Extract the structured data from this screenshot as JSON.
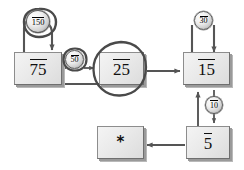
{
  "diagram": {
    "type": "state-transition-diagram",
    "background_color": "#ffffff",
    "edge_color": "#555555",
    "node_fill": "#eaeaea",
    "node_border": "#8d8d8d",
    "annotation_color": "#4a4a4a",
    "nodes": [
      {
        "id": "n75",
        "label": "75",
        "shape": "box",
        "overline": true
      },
      {
        "id": "n25",
        "label": "25",
        "shape": "box",
        "overline": true,
        "annotated": true
      },
      {
        "id": "n15",
        "label": "15",
        "shape": "box",
        "overline": true
      },
      {
        "id": "n5",
        "label": "5",
        "shape": "box",
        "overline": true
      },
      {
        "id": "nstar",
        "label": "*",
        "shape": "box",
        "overline": false
      }
    ],
    "edge_labels": [
      {
        "id": "e150",
        "label": "150",
        "shape": "circle",
        "overline": true,
        "annotated": true
      },
      {
        "id": "e50",
        "label": "50",
        "shape": "circle",
        "overline": true,
        "annotated": true
      },
      {
        "id": "e30",
        "label": "30",
        "shape": "circle",
        "overline": true
      },
      {
        "id": "e10",
        "label": "10",
        "shape": "circle",
        "overline": true
      }
    ]
  }
}
